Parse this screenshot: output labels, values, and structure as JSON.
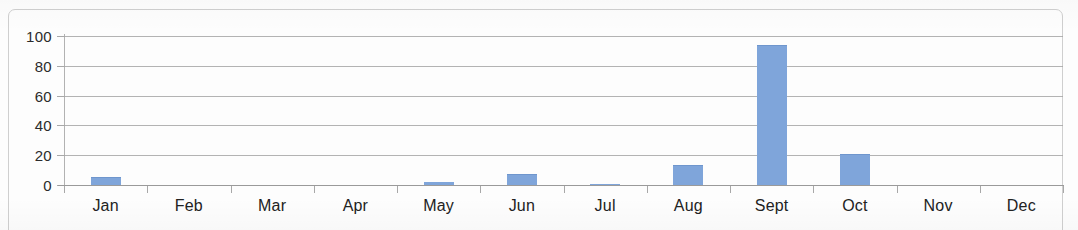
{
  "chart_data": {
    "type": "bar",
    "title": "",
    "subtitle": "",
    "xlabel": "",
    "ylabel": "",
    "categories": [
      "Jan",
      "Feb",
      "Mar",
      "Apr",
      "May",
      "Jun",
      "Jul",
      "Aug",
      "Sept",
      "Oct",
      "Nov",
      "Dec"
    ],
    "values": [
      5,
      0,
      0,
      0,
      2,
      7,
      0.5,
      13,
      93,
      20,
      0,
      0
    ],
    "series": [
      {
        "name": "",
        "values": [
          5,
          0,
          0,
          0,
          2,
          7,
          0.5,
          13,
          93,
          20,
          0,
          0
        ],
        "color": "#7fa5da"
      }
    ],
    "ylim": [
      0,
      100
    ],
    "ytick_labels": [
      "0",
      "20",
      "40",
      "60",
      "80",
      "100"
    ],
    "ytick_values": [
      0,
      20,
      40,
      60,
      80,
      100
    ],
    "grid": true,
    "grid_axis": "y",
    "legend": false,
    "legend_position": "none",
    "annotations": []
  },
  "axes": {
    "y_labels": [
      "100",
      "80",
      "60",
      "40",
      "20",
      "0"
    ],
    "x_labels": [
      "Jan",
      "Feb",
      "Mar",
      "Apr",
      "May",
      "Jun",
      "Jul",
      "Aug",
      "Sept",
      "Oct",
      "Nov",
      "Dec"
    ]
  },
  "style": {
    "bar_color": "#7fa5da",
    "bar_border_color": "#6f96cd",
    "gridline_color": "#a6a6a6",
    "axis_color": "#9a9a9a",
    "text_color": "#222222",
    "frame_color": "#cfcfcf",
    "background": "#fdfdfd"
  }
}
